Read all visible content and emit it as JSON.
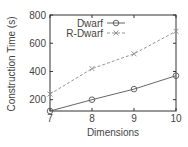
{
  "chart_data": {
    "type": "line",
    "title": "",
    "xlabel": "Dimensions",
    "ylabel": "Construction Time (s)",
    "x": [
      7,
      8,
      9,
      10
    ],
    "xticks": [
      "7",
      "8",
      "9",
      "10"
    ],
    "yticks": [
      "200",
      "400",
      "600",
      "800"
    ],
    "xlim": [
      7,
      10
    ],
    "ylim": [
      120,
      800
    ],
    "grid": false,
    "legend_position": "upper left",
    "series": [
      {
        "name": "Dwarf",
        "values": [
          120,
          200,
          275,
          370
        ],
        "marker": "circle",
        "style": "solid",
        "color": "#555555"
      },
      {
        "name": "R-Dwarf",
        "values": [
          240,
          420,
          525,
          685
        ],
        "marker": "x",
        "style": "dashed",
        "color": "#888888"
      }
    ]
  }
}
